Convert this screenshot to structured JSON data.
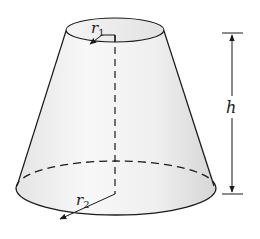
{
  "diagram": {
    "type": "frustum-of-cone",
    "labels": {
      "top_radius": {
        "main": "r",
        "sub": "1"
      },
      "bottom_radius": {
        "main": "r",
        "sub": "2"
      },
      "height": "h"
    },
    "colors": {
      "stroke": "#1a1a1a",
      "fill_light": "#f7f7f7",
      "fill_dark": "#dcdcdc",
      "background": "#ffffff"
    }
  }
}
